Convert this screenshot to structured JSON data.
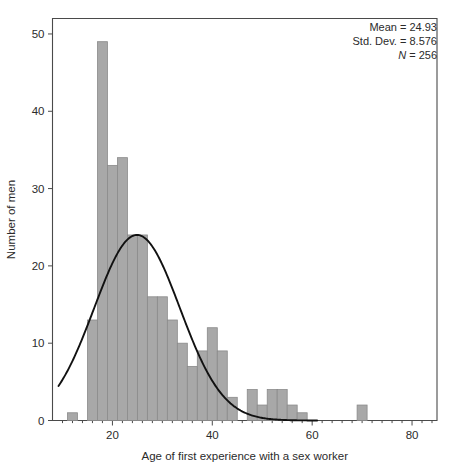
{
  "chart_data": {
    "type": "bar",
    "title": "",
    "subtitle": "",
    "xlabel": "Age of first experience with a sex worker",
    "ylabel": "Number of men",
    "xlim": [
      8,
      85
    ],
    "ylim": [
      0,
      52
    ],
    "xticks": [
      20,
      40,
      60,
      80
    ],
    "yticks": [
      0,
      10,
      20,
      30,
      40,
      50
    ],
    "grid": false,
    "legend_position": "top-right",
    "bin_width": 2,
    "bar_color": "#a8a8a8",
    "bar_edge_color": "#8a8a8a",
    "curve_color": "#111111",
    "curve_type": "normal-density-overlay",
    "bins": [
      {
        "center": 12,
        "value": 1
      },
      {
        "center": 16,
        "value": 13
      },
      {
        "center": 18,
        "value": 49
      },
      {
        "center": 20,
        "value": 33
      },
      {
        "center": 22,
        "value": 34
      },
      {
        "center": 24,
        "value": 24
      },
      {
        "center": 26,
        "value": 24
      },
      {
        "center": 28,
        "value": 16
      },
      {
        "center": 30,
        "value": 16
      },
      {
        "center": 32,
        "value": 13
      },
      {
        "center": 34,
        "value": 10
      },
      {
        "center": 36,
        "value": 7
      },
      {
        "center": 38,
        "value": 9
      },
      {
        "center": 40,
        "value": 12
      },
      {
        "center": 42,
        "value": 9
      },
      {
        "center": 44,
        "value": 3
      },
      {
        "center": 48,
        "value": 4
      },
      {
        "center": 50,
        "value": 2
      },
      {
        "center": 52,
        "value": 4
      },
      {
        "center": 54,
        "value": 4
      },
      {
        "center": 56,
        "value": 2
      },
      {
        "center": 58,
        "value": 1
      },
      {
        "center": 70,
        "value": 2
      }
    ],
    "curve_params": {
      "mean": 24.93,
      "std": 8.576,
      "peak_value": 24
    }
  },
  "stats": {
    "mean_label": "Mean = 24.93",
    "std_label": "Std. Dev. = 8.576",
    "n_prefix": "N",
    "n_label": " = 256"
  },
  "axis": {
    "x_title": "Age of first experience with a sex worker",
    "y_title": "Number of men",
    "x_tick_labels": [
      "20",
      "40",
      "60",
      "80"
    ],
    "y_tick_labels": [
      "0",
      "10",
      "20",
      "30",
      "40",
      "50"
    ]
  }
}
